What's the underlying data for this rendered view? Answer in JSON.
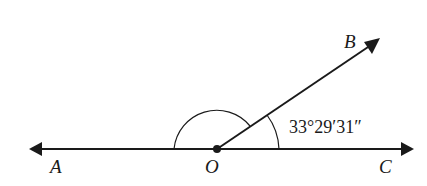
{
  "diagram": {
    "type": "angle-diagram",
    "points": {
      "A": {
        "label": "A"
      },
      "O": {
        "label": "O"
      },
      "B": {
        "label": "B"
      },
      "C": {
        "label": "C"
      }
    },
    "angle_BOC": {
      "label": "33°29′31″"
    },
    "elements": [
      "line AC through O",
      "ray OB",
      "arc marking angle AOB",
      "arc marking angle BOC"
    ]
  }
}
